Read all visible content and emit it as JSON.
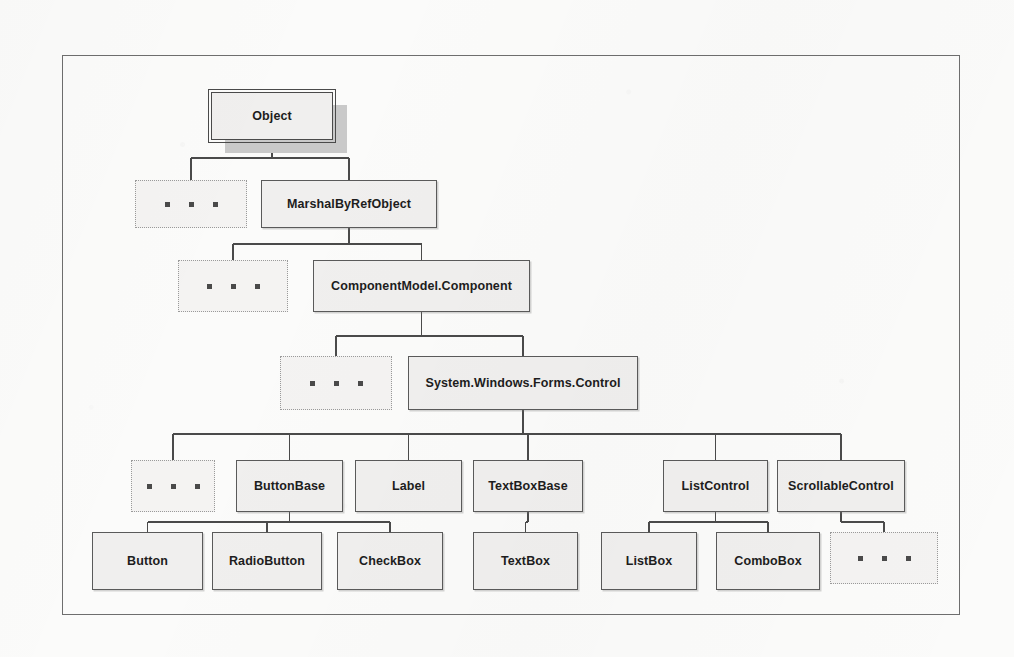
{
  "diagram": {
    "type": "class-hierarchy-tree",
    "background_color": "#fbfbfa",
    "node_fill": "#f0efee",
    "node_border": "#5a5a5a",
    "edge_color": "#4a4a4a",
    "ellipsis_border": "#9a9a9a",
    "frame": {
      "x": 62,
      "y": 55,
      "width": 898,
      "height": 560
    },
    "ellipsis_glyph": "...",
    "nodes": [
      {
        "id": "object",
        "label": "Object",
        "x": 211,
        "y": 92,
        "w": 122,
        "h": 48,
        "kind": "root"
      },
      {
        "id": "ellipsis-1",
        "label": "...",
        "x": 135,
        "y": 180,
        "w": 112,
        "h": 48,
        "kind": "ellipsis"
      },
      {
        "id": "marshalbyrefobject",
        "label": "MarshalByRefObject",
        "x": 261,
        "y": 180,
        "w": 176,
        "h": 48,
        "kind": "class"
      },
      {
        "id": "ellipsis-2",
        "label": "...",
        "x": 178,
        "y": 260,
        "w": 110,
        "h": 52,
        "kind": "ellipsis"
      },
      {
        "id": "component",
        "label": "ComponentModel.Component",
        "x": 313,
        "y": 260,
        "w": 217,
        "h": 52,
        "kind": "class"
      },
      {
        "id": "ellipsis-3",
        "label": "...",
        "x": 280,
        "y": 356,
        "w": 112,
        "h": 54,
        "kind": "ellipsis"
      },
      {
        "id": "control",
        "label": "System.Windows.Forms.Control",
        "x": 408,
        "y": 356,
        "w": 230,
        "h": 54,
        "kind": "class"
      },
      {
        "id": "ellipsis-4",
        "label": "...",
        "x": 131,
        "y": 460,
        "w": 84,
        "h": 52,
        "kind": "ellipsis"
      },
      {
        "id": "buttonbase",
        "label": "ButtonBase",
        "x": 236,
        "y": 460,
        "w": 107,
        "h": 52,
        "kind": "class"
      },
      {
        "id": "label",
        "label": "Label",
        "x": 355,
        "y": 460,
        "w": 107,
        "h": 52,
        "kind": "class"
      },
      {
        "id": "textboxbase",
        "label": "TextBoxBase",
        "x": 473,
        "y": 460,
        "w": 110,
        "h": 52,
        "kind": "class"
      },
      {
        "id": "listcontrol",
        "label": "ListControl",
        "x": 663,
        "y": 460,
        "w": 105,
        "h": 52,
        "kind": "class"
      },
      {
        "id": "scrollablecontrol",
        "label": "ScrollableControl",
        "x": 777,
        "y": 460,
        "w": 128,
        "h": 52,
        "kind": "class"
      },
      {
        "id": "button",
        "label": "Button",
        "x": 92,
        "y": 532,
        "w": 111,
        "h": 58,
        "kind": "class"
      },
      {
        "id": "radiobutton",
        "label": "RadioButton",
        "x": 212,
        "y": 532,
        "w": 110,
        "h": 58,
        "kind": "class"
      },
      {
        "id": "checkbox",
        "label": "CheckBox",
        "x": 337,
        "y": 532,
        "w": 106,
        "h": 58,
        "kind": "class"
      },
      {
        "id": "textbox",
        "label": "TextBox",
        "x": 473,
        "y": 532,
        "w": 105,
        "h": 58,
        "kind": "class"
      },
      {
        "id": "listbox",
        "label": "ListBox",
        "x": 601,
        "y": 532,
        "w": 96,
        "h": 58,
        "kind": "class"
      },
      {
        "id": "combobox",
        "label": "ComboBox",
        "x": 716,
        "y": 532,
        "w": 104,
        "h": 58,
        "kind": "class"
      },
      {
        "id": "ellipsis-5",
        "label": "...",
        "x": 830,
        "y": 532,
        "w": 108,
        "h": 52,
        "kind": "ellipsis"
      }
    ],
    "edges": [
      {
        "from": "object",
        "to": "ellipsis-1",
        "bus_y": 158
      },
      {
        "from": "object",
        "to": "marshalbyrefobject",
        "bus_y": 158
      },
      {
        "from": "marshalbyrefobject",
        "to": "ellipsis-2",
        "bus_y": 244
      },
      {
        "from": "marshalbyrefobject",
        "to": "component",
        "bus_y": 244
      },
      {
        "from": "component",
        "to": "ellipsis-3",
        "bus_y": 336
      },
      {
        "from": "component",
        "to": "control",
        "bus_y": 336
      },
      {
        "from": "control",
        "to": "ellipsis-4",
        "bus_y": 434
      },
      {
        "from": "control",
        "to": "buttonbase",
        "bus_y": 434
      },
      {
        "from": "control",
        "to": "label",
        "bus_y": 434
      },
      {
        "from": "control",
        "to": "textboxbase",
        "bus_y": 434
      },
      {
        "from": "control",
        "to": "listcontrol",
        "bus_y": 434
      },
      {
        "from": "control",
        "to": "scrollablecontrol",
        "bus_y": 434
      },
      {
        "from": "buttonbase",
        "to": "button",
        "bus_y": 522
      },
      {
        "from": "buttonbase",
        "to": "radiobutton",
        "bus_y": 522
      },
      {
        "from": "buttonbase",
        "to": "checkbox",
        "bus_y": 522
      },
      {
        "from": "textboxbase",
        "to": "textbox",
        "bus_y": 522
      },
      {
        "from": "listcontrol",
        "to": "listbox",
        "bus_y": 522
      },
      {
        "from": "listcontrol",
        "to": "combobox",
        "bus_y": 522
      },
      {
        "from": "scrollablecontrol",
        "to": "ellipsis-5",
        "bus_y": 522
      }
    ]
  }
}
